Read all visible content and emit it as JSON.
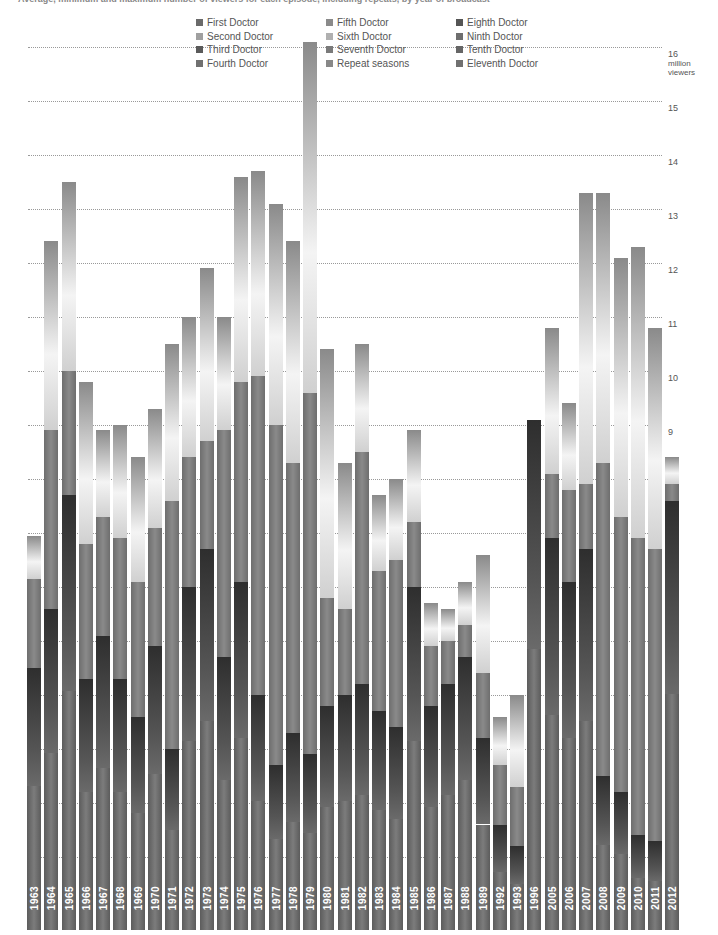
{
  "title": "Average, minimum and maximum number of viewers for each episode, including repeats, by year of broadcast",
  "legend": [
    {
      "label": "First Doctor",
      "color": "#6a6a6a"
    },
    {
      "label": "Second Doctor",
      "color": "#a0a0a0"
    },
    {
      "label": "Third Doctor",
      "color": "#5a5a5a"
    },
    {
      "label": "Fourth Doctor",
      "color": "#707070"
    },
    {
      "label": "Fifth Doctor",
      "color": "#8a8a8a"
    },
    {
      "label": "Sixth Doctor",
      "color": "#b0b0b0"
    },
    {
      "label": "Seventh Doctor",
      "color": "#7a7a7a"
    },
    {
      "label": "Repeat seasons",
      "color": "#888888"
    },
    {
      "label": "Eighth Doctor",
      "color": "#555555"
    },
    {
      "label": "Ninth Doctor",
      "color": "#6e6e6e"
    },
    {
      "label": "Tenth Doctor",
      "color": "#666666"
    },
    {
      "label": "Eleventh Doctor",
      "color": "#707070"
    }
  ],
  "axis": {
    "unit_line1": "million",
    "unit_line2": "viewers",
    "ticks": [
      "1",
      "2",
      "3",
      "4",
      "5",
      "6",
      "7",
      "8",
      "9",
      "10",
      "11",
      "12",
      "13",
      "14",
      "15",
      "16"
    ]
  },
  "chart_data": {
    "type": "bar",
    "title": "Average, minimum and maximum number of viewers for each episode, including repeats, by year of broadcast",
    "xlabel": "",
    "ylabel": "million viewers",
    "ylim": [
      0.5,
      16
    ],
    "grid": true,
    "legend_position": "top",
    "categories": [
      "1963",
      "1964",
      "1965",
      "1966",
      "1967",
      "1968",
      "1969",
      "1970",
      "1971",
      "1972",
      "1973",
      "1974",
      "1975",
      "1976",
      "1977",
      "1978",
      "1979",
      "1980",
      "1981",
      "1982",
      "1983",
      "1984",
      "1985",
      "1986",
      "1987",
      "1988",
      "1989",
      "1992",
      "1993",
      "1996",
      "2005",
      "2006",
      "2007",
      "2008",
      "2009",
      "2010",
      "2011",
      "2012"
    ],
    "series": [
      {
        "name": "Maximum",
        "values": [
          6.95,
          12.4,
          13.5,
          9.8,
          8.9,
          9.0,
          8.4,
          9.3,
          10.5,
          11.0,
          11.9,
          11.0,
          13.6,
          13.7,
          13.1,
          12.4,
          16.1,
          10.4,
          8.3,
          10.5,
          7.7,
          8.0,
          8.9,
          5.7,
          5.6,
          6.1,
          6.6,
          3.6,
          4.0,
          9.1,
          10.8,
          9.4,
          13.3,
          13.3,
          12.1,
          12.3,
          10.8,
          8.4
        ]
      },
      {
        "name": "Average",
        "values": [
          6.15,
          8.9,
          10.0,
          6.8,
          7.3,
          6.9,
          6.1,
          7.1,
          7.6,
          8.4,
          8.7,
          8.9,
          9.8,
          9.9,
          9.0,
          8.3,
          9.6,
          5.8,
          5.6,
          8.5,
          6.3,
          6.5,
          7.2,
          4.9,
          5.0,
          5.3,
          4.4,
          2.7,
          2.3,
          9.1,
          8.1,
          7.8,
          7.9,
          8.3,
          7.3,
          6.9,
          6.7,
          7.9
        ]
      },
      {
        "name": "Minimum",
        "values": [
          4.5,
          5.6,
          7.7,
          4.3,
          5.1,
          4.3,
          3.6,
          4.9,
          3.0,
          6.0,
          6.7,
          4.7,
          6.1,
          4.0,
          2.7,
          3.3,
          2.9,
          3.8,
          4.0,
          4.2,
          3.7,
          3.4,
          6.0,
          3.8,
          4.2,
          4.7,
          3.2,
          1.6,
          1.2,
          9.1,
          6.9,
          6.1,
          6.7,
          2.5,
          2.2,
          1.4,
          1.3,
          7.6
        ]
      }
    ]
  }
}
